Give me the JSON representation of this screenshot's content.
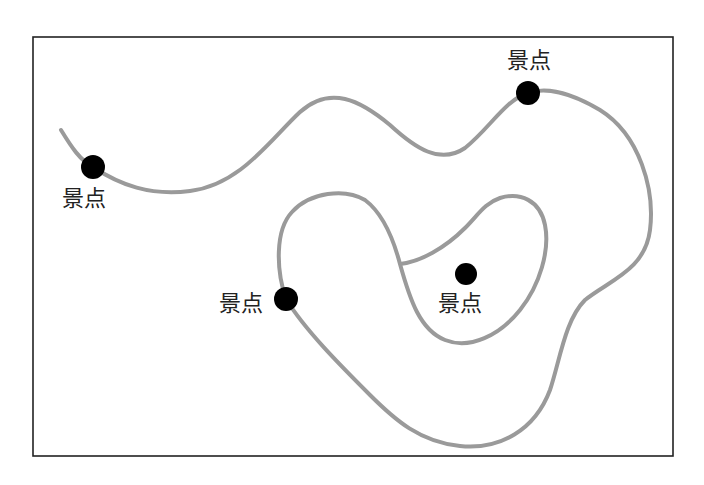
{
  "diagram": {
    "type": "route-map",
    "frame": {
      "x": 33,
      "y": 37,
      "width": 640,
      "height": 419,
      "stroke": "#222222"
    },
    "road": {
      "stroke": "#9a9a9a",
      "width": 4
    },
    "spots": [
      {
        "label": "景点",
        "cx": 93,
        "cy": 167,
        "r": 12,
        "label_x": 62,
        "label_y": 188
      },
      {
        "label": "景点",
        "cx": 528,
        "cy": 93,
        "r": 12,
        "label_x": 507,
        "label_y": 50
      },
      {
        "label": "景点",
        "cx": 286,
        "cy": 299,
        "r": 12,
        "label_x": 219,
        "label_y": 293
      },
      {
        "label": "景点",
        "cx": 466,
        "cy": 274,
        "r": 11,
        "label_x": 438,
        "label_y": 293
      }
    ],
    "dot_color": "#000000"
  }
}
